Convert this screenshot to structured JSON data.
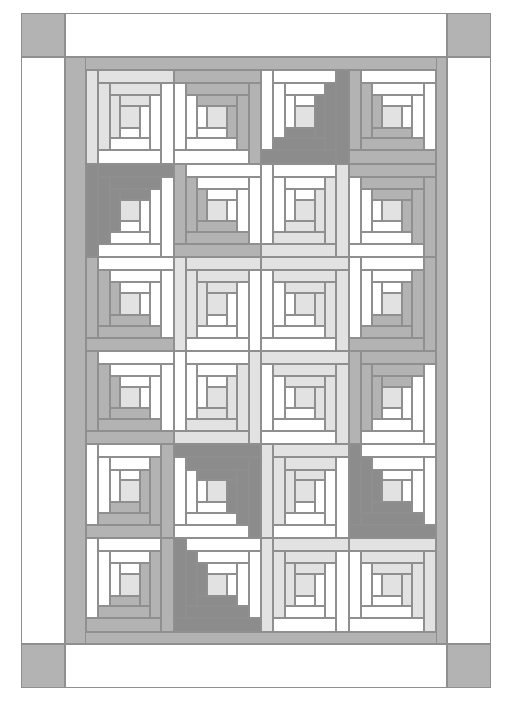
{
  "document": {
    "type": "quilt-pattern-diagram",
    "title": "Log Cabin Quilt Layout Diagram",
    "description": "Line-drawing quilt layout: 4 columns by 6 rows of Log Cabin blocks framed by an inner gray border, white outer border and gray corner squares.",
    "page": {
      "width": 508,
      "height": 703,
      "background": "#ffffff"
    }
  },
  "palette": {
    "white": "#ffffff",
    "off_white": "#fafafa",
    "light_gray": "#e2e2e2",
    "mid_light_gray": "#d2d2d2",
    "medium_gray": "#b3b3b3",
    "dark_gray": "#8c8c8c",
    "outline": "#8f8f8f",
    "border_gray": "#b3b3b3"
  },
  "frame": {
    "page_border_color": "#9a9a9a",
    "corner_square_color": "#b3b3b3",
    "outer_band_color": "#ffffff",
    "inner_border_color": "#b3b3b3",
    "corner_squares": [
      {
        "name": "corner-top-left",
        "x": 0,
        "y": 0,
        "w": 44,
        "h": 44
      },
      {
        "name": "corner-top-right",
        "x": 426,
        "y": 0,
        "w": 44,
        "h": 44
      },
      {
        "name": "corner-bottom-left",
        "x": 0,
        "y": 631,
        "w": 44,
        "h": 44
      },
      {
        "name": "corner-bottom-right",
        "x": 426,
        "y": 631,
        "w": 44,
        "h": 44
      }
    ],
    "outer_bands": [
      {
        "name": "outer-band-top",
        "x": 44,
        "y": 0,
        "w": 382,
        "h": 44
      },
      {
        "name": "outer-band-bottom",
        "x": 44,
        "y": 631,
        "w": 382,
        "h": 44
      },
      {
        "name": "outer-band-left",
        "x": 0,
        "y": 44,
        "w": 44,
        "h": 587
      },
      {
        "name": "outer-band-right",
        "x": 426,
        "y": 44,
        "w": 44,
        "h": 587
      }
    ],
    "inner_borders": [
      {
        "name": "inner-border-top",
        "x": 44,
        "y": 44,
        "w": 382,
        "h": 13
      },
      {
        "name": "inner-border-bottom",
        "x": 44,
        "y": 619,
        "w": 382,
        "h": 12
      },
      {
        "name": "inner-border-left",
        "x": 44,
        "y": 44,
        "w": 21,
        "h": 587
      },
      {
        "name": "inner-border-right",
        "x": 415,
        "y": 44,
        "w": 11,
        "h": 587
      }
    ]
  },
  "grid": {
    "columns": 4,
    "rows": 6,
    "block_width": 87.5,
    "block_height": 93.6,
    "origin_x": 65,
    "origin_y": 57,
    "total_blocks": 24
  },
  "block_spec": {
    "logs_per_block": 13,
    "center_label": "center-square",
    "rings": 3,
    "note": "Each Log Cabin block is split diagonally: one half light (white / off-white), one half shaded (light, medium or dark gray). Rotation determines which corner the shaded half points to."
  },
  "blocks": [
    {
      "row": 0,
      "col": 0,
      "rot": 180,
      "shade": "#e2e2e2",
      "light": "#ffffff",
      "center": "#e2e2e2"
    },
    {
      "row": 0,
      "col": 1,
      "rot": 270,
      "shade": "#b3b3b3",
      "light": "#ffffff",
      "center": "#e2e2e2"
    },
    {
      "row": 0,
      "col": 2,
      "rot": 0,
      "shade": "#8c8c8c",
      "light": "#ffffff",
      "center": "#e2e2e2"
    },
    {
      "row": 0,
      "col": 3,
      "rot": 90,
      "shade": "#b3b3b3",
      "light": "#ffffff",
      "center": "#e2e2e2"
    },
    {
      "row": 1,
      "col": 0,
      "rot": 180,
      "shade": "#8c8c8c",
      "light": "#ffffff",
      "center": "#e2e2e2"
    },
    {
      "row": 1,
      "col": 1,
      "rot": 90,
      "shade": "#b3b3b3",
      "light": "#ffffff",
      "center": "#e2e2e2"
    },
    {
      "row": 1,
      "col": 2,
      "rot": 0,
      "shade": "#e2e2e2",
      "light": "#ffffff",
      "center": "#e2e2e2"
    },
    {
      "row": 1,
      "col": 3,
      "rot": 270,
      "shade": "#b3b3b3",
      "light": "#ffffff",
      "center": "#e2e2e2"
    },
    {
      "row": 2,
      "col": 0,
      "rot": 90,
      "shade": "#b3b3b3",
      "light": "#ffffff",
      "center": "#e2e2e2"
    },
    {
      "row": 2,
      "col": 1,
      "rot": 180,
      "shade": "#e2e2e2",
      "light": "#ffffff",
      "center": "#e2e2e2"
    },
    {
      "row": 2,
      "col": 2,
      "rot": 270,
      "shade": "#e2e2e2",
      "light": "#ffffff",
      "center": "#e2e2e2"
    },
    {
      "row": 2,
      "col": 3,
      "rot": 0,
      "shade": "#b3b3b3",
      "light": "#ffffff",
      "center": "#e2e2e2"
    },
    {
      "row": 3,
      "col": 0,
      "rot": 90,
      "shade": "#b3b3b3",
      "light": "#ffffff",
      "center": "#e2e2e2"
    },
    {
      "row": 3,
      "col": 1,
      "rot": 0,
      "shade": "#e2e2e2",
      "light": "#ffffff",
      "center": "#e2e2e2"
    },
    {
      "row": 3,
      "col": 2,
      "rot": 270,
      "shade": "#e2e2e2",
      "light": "#ffffff",
      "center": "#e2e2e2"
    },
    {
      "row": 3,
      "col": 3,
      "rot": 180,
      "shade": "#b3b3b3",
      "light": "#ffffff",
      "center": "#e2e2e2"
    },
    {
      "row": 4,
      "col": 0,
      "rot": 0,
      "shade": "#b3b3b3",
      "light": "#ffffff",
      "center": "#e2e2e2"
    },
    {
      "row": 4,
      "col": 1,
      "rot": 270,
      "shade": "#8c8c8c",
      "light": "#ffffff",
      "center": "#e2e2e2"
    },
    {
      "row": 4,
      "col": 2,
      "rot": 180,
      "shade": "#e2e2e2",
      "light": "#ffffff",
      "center": "#e2e2e2"
    },
    {
      "row": 4,
      "col": 3,
      "rot": 90,
      "shade": "#8c8c8c",
      "light": "#ffffff",
      "center": "#e2e2e2"
    },
    {
      "row": 5,
      "col": 0,
      "rot": 0,
      "shade": "#b3b3b3",
      "light": "#ffffff",
      "center": "#e2e2e2"
    },
    {
      "row": 5,
      "col": 1,
      "rot": 90,
      "shade": "#8c8c8c",
      "light": "#ffffff",
      "center": "#e2e2e2"
    },
    {
      "row": 5,
      "col": 2,
      "rot": 180,
      "shade": "#e2e2e2",
      "light": "#ffffff",
      "center": "#e2e2e2"
    },
    {
      "row": 5,
      "col": 3,
      "rot": 270,
      "shade": "#e2e2e2",
      "light": "#ffffff",
      "center": "#e2e2e2"
    }
  ]
}
